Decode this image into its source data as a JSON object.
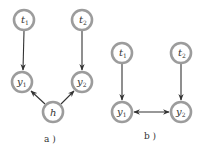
{
  "diagram": {
    "panels": [
      {
        "id": "a",
        "caption": "a )",
        "nodes": [
          {
            "id": "t1",
            "label": "t",
            "sub": "1",
            "cx": 24,
            "cy": 20
          },
          {
            "id": "t2",
            "label": "t",
            "sub": "2",
            "cx": 82,
            "cy": 20
          },
          {
            "id": "y1",
            "label": "y",
            "sub": "1",
            "cx": 22,
            "cy": 82
          },
          {
            "id": "y2",
            "label": "y",
            "sub": "2",
            "cx": 82,
            "cy": 82
          },
          {
            "id": "h",
            "label": "h",
            "sub": "",
            "cx": 53,
            "cy": 112
          }
        ],
        "edges": [
          {
            "from": "t1",
            "to": "y1",
            "type": "directed"
          },
          {
            "from": "t2",
            "to": "y2",
            "type": "directed"
          },
          {
            "from": "h",
            "to": "y1",
            "type": "directed"
          },
          {
            "from": "h",
            "to": "y2",
            "type": "directed"
          }
        ]
      },
      {
        "id": "b",
        "caption": "b )",
        "nodes": [
          {
            "id": "t1",
            "label": "t",
            "sub": "1",
            "cx": 122,
            "cy": 53
          },
          {
            "id": "t2",
            "label": "t",
            "sub": "2",
            "cx": 181,
            "cy": 53
          },
          {
            "id": "y1",
            "label": "y",
            "sub": "1",
            "cx": 122,
            "cy": 112
          },
          {
            "id": "y2",
            "label": "y",
            "sub": "2",
            "cx": 181,
            "cy": 112
          }
        ],
        "edges": [
          {
            "from": "t1",
            "to": "y1",
            "type": "directed"
          },
          {
            "from": "t2",
            "to": "y2",
            "type": "directed"
          },
          {
            "from": "y1",
            "to": "y2",
            "type": "bidirected"
          }
        ]
      }
    ],
    "colors": {
      "node_stroke": "#9c9c9c",
      "edge": "#333333",
      "text": "#333333"
    }
  }
}
